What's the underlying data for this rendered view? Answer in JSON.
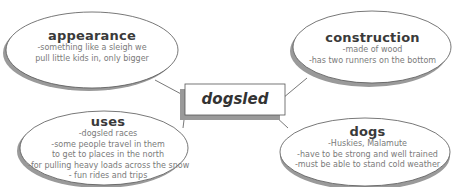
{
  "center": {
    "label": "dogsled"
  },
  "nodes": [
    {
      "id": "appearance",
      "title": "appearance",
      "lines": [
        "-something like a sleigh we",
        "pull little kids in, only bigger"
      ]
    },
    {
      "id": "construction",
      "title": "construction",
      "lines": [
        "-made of wood",
        "-has two runners on the bottom"
      ]
    },
    {
      "id": "uses",
      "title": "uses",
      "lines": [
        "-dogsled races",
        "-some people travel in them",
        "to get to places in the north",
        "-for pulling heavy loads across the snow",
        "- fun rides and trips"
      ]
    },
    {
      "id": "dogs",
      "title": "dogs",
      "lines": [
        "-Huskies, Malamute",
        "-have to be strong and well trained",
        "-must be able to stand cold weather"
      ]
    }
  ],
  "colors": {
    "outline": "#555555",
    "shadow": "#9a9a9a",
    "text": "#7a7a7a",
    "title": "#3a3a3a"
  }
}
